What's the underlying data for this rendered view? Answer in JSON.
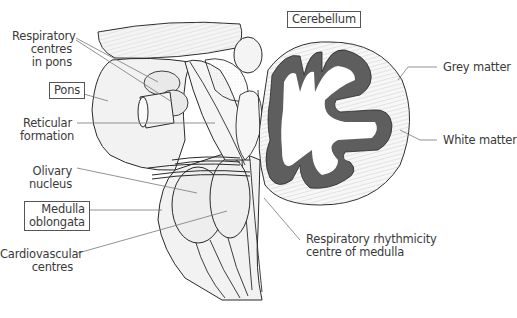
{
  "figure": {
    "top_cropped_text": "(partially cropped text at top edge)",
    "colors": {
      "outline": "#2a2a2a",
      "leader_line": "#777777",
      "grey_matter": "#5e5e5e",
      "white_matter": "#ffffff",
      "tissue_fill": "#f2f2f2",
      "label_text": "#3a3a3a",
      "label_box_border": "#555555"
    }
  },
  "labels": {
    "respiratory_pons": {
      "line1": "Respiratory",
      "line2": "centres",
      "line3": "in pons",
      "boxed": false
    },
    "pons": {
      "text": "Pons",
      "boxed": true
    },
    "reticular": {
      "line1": "Reticular",
      "line2": "formation",
      "boxed": false
    },
    "olivary": {
      "line1": "Olivary",
      "line2": "nucleus",
      "boxed": false
    },
    "medulla": {
      "line1": "Medulla",
      "line2": "oblongata",
      "boxed": true
    },
    "cardiovascular": {
      "line1": "Cardiovascular",
      "line2": "centres",
      "boxed": false
    },
    "cerebellum": {
      "text": "Cerebellum",
      "boxed": true
    },
    "grey_matter": {
      "text": "Grey matter",
      "boxed": false
    },
    "white_matter": {
      "text": "White matter",
      "boxed": false
    },
    "respiratory_rhythm": {
      "line1": "Respiratory rhythmicity",
      "line2": "centre of medulla",
      "boxed": false
    }
  }
}
